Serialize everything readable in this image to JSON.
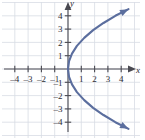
{
  "figure": {
    "name": "sideways-parabola-graph",
    "background_color": "#ffffff",
    "grid_color": "#d8dce4",
    "axis_color": "#4a4a52",
    "curve_color": "#5b6e9e",
    "tick_text_color": "#2b2b33"
  },
  "axes": {
    "x_axis_label": "x",
    "y_axis_label": "y",
    "x_ticks": [
      {
        "value": -4,
        "label": "–4"
      },
      {
        "value": -3,
        "label": "–3"
      },
      {
        "value": -2,
        "label": "–2"
      },
      {
        "value": -1,
        "label": "–1"
      },
      {
        "value": 1,
        "label": "1"
      },
      {
        "value": 2,
        "label": "2"
      },
      {
        "value": 3,
        "label": "3"
      },
      {
        "value": 4,
        "label": "4"
      }
    ],
    "y_ticks": [
      {
        "value": 4,
        "label": "4"
      },
      {
        "value": 3,
        "label": "3"
      },
      {
        "value": 2,
        "label": "2"
      },
      {
        "value": 1,
        "label": "1"
      },
      {
        "value": -1,
        "label": "–1"
      },
      {
        "value": -2,
        "label": "–2"
      },
      {
        "value": -3,
        "label": "–3"
      },
      {
        "value": -4,
        "label": "–4"
      }
    ]
  },
  "chart_data": {
    "type": "line",
    "title": "",
    "xlabel": "x",
    "ylabel": "y",
    "xlim": [
      -4.9,
      5.3
    ],
    "ylim": [
      -4.9,
      5.0
    ],
    "grid": true,
    "legend": "none",
    "series": [
      {
        "name": "sideways parabola opening right",
        "equation": "x = y^2 / 4.5",
        "vertex": [
          0,
          0
        ],
        "arrowheads": [
          "start",
          "end"
        ],
        "x": [
          4.55,
          3.56,
          2.67,
          1.89,
          1.22,
          0.67,
          0.3,
          0.08,
          0.0,
          0.08,
          0.3,
          0.67,
          1.22,
          1.89,
          2.67,
          3.56,
          4.55
        ],
        "y": [
          4.5,
          4.0,
          3.46,
          2.92,
          2.34,
          1.74,
          1.16,
          0.6,
          0.0,
          -0.6,
          -1.16,
          -1.74,
          -2.34,
          -2.92,
          -3.46,
          -4.0,
          -4.5
        ]
      }
    ]
  }
}
